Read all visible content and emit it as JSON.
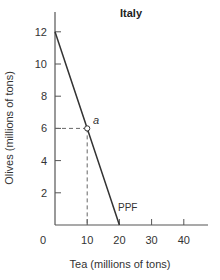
{
  "chart_data": {
    "type": "line",
    "title": "Italy",
    "xlabel": "Tea (millions of tons)",
    "ylabel": "Olives (millions of tons)",
    "xlim": [
      0,
      47
    ],
    "ylim": [
      0,
      13
    ],
    "x_ticks": [
      10,
      20,
      30,
      40
    ],
    "x_tick_labels": [
      "10",
      "20",
      "30",
      "40"
    ],
    "y_ticks": [
      2,
      4,
      6,
      8,
      10,
      12
    ],
    "y_tick_labels": [
      "2",
      "4",
      "6",
      "8",
      "10",
      "12"
    ],
    "origin_label": "0",
    "grid": false,
    "legend": null,
    "series": [
      {
        "name": "PPF",
        "x": [
          0,
          20
        ],
        "y": [
          12,
          0
        ],
        "color": "#333333"
      }
    ],
    "points": [
      {
        "label": "a",
        "x": 10,
        "y": 6,
        "marker": "open-circle",
        "dashed_guides": true
      }
    ],
    "annotations": [
      {
        "text": "PPF",
        "x": 21,
        "y": 1.2
      },
      {
        "text": "a",
        "x": 11,
        "y": 6.5
      }
    ]
  },
  "labels": {
    "title": "Italy",
    "xlabel": "Tea (millions of tons)",
    "ylabel": "Olives (millions of tons)",
    "origin": "0",
    "curve": "PPF",
    "point": "a"
  },
  "colors": {
    "axis": "#555555",
    "curve": "#333333",
    "guide": "#666666",
    "text": "#333333"
  }
}
